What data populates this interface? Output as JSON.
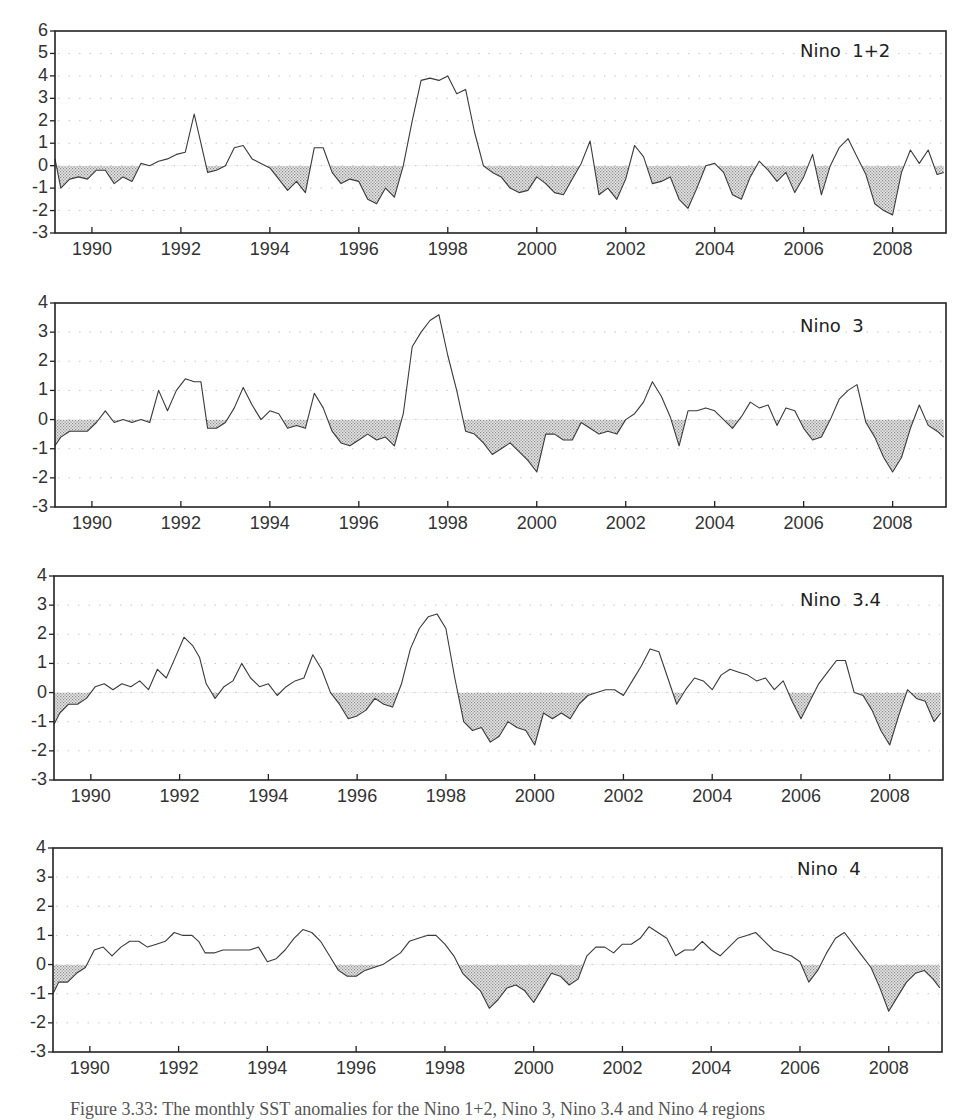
{
  "figure": {
    "caption": "Figure 3.33: The monthly SST anomalies for the Nino 1+2, Nino 3, Nino 3.4 and Nino 4 regions"
  },
  "chart_data": [
    {
      "type": "area",
      "title": "Nino  1+2",
      "xlabel": "",
      "ylabel": "",
      "xlim": [
        1989.17,
        2009.2
      ],
      "ylim": [
        -3,
        6
      ],
      "yticks": [
        6,
        5,
        4,
        3,
        2,
        1,
        0,
        -1,
        -2,
        -3
      ],
      "xticks": [
        1990,
        1992,
        1994,
        1996,
        1998,
        2000,
        2002,
        2004,
        2006,
        2008
      ],
      "grid": "dotted-horizontal",
      "negative_fill": "stippled-gray",
      "x": [
        1989.17,
        1989.3,
        1989.5,
        1989.7,
        1989.9,
        1990.1,
        1990.3,
        1990.5,
        1990.7,
        1990.9,
        1991.1,
        1991.3,
        1991.5,
        1991.7,
        1991.9,
        1992.1,
        1992.3,
        1992.45,
        1992.6,
        1992.8,
        1993.0,
        1993.2,
        1993.4,
        1993.6,
        1993.8,
        1994.0,
        1994.2,
        1994.4,
        1994.6,
        1994.8,
        1995.0,
        1995.2,
        1995.4,
        1995.6,
        1995.8,
        1996.0,
        1996.2,
        1996.4,
        1996.6,
        1996.8,
        1997.0,
        1997.2,
        1997.4,
        1997.6,
        1997.8,
        1998.0,
        1998.2,
        1998.4,
        1998.6,
        1998.8,
        1999.0,
        1999.2,
        1999.4,
        1999.6,
        1999.8,
        2000.0,
        2000.2,
        2000.4,
        2000.6,
        2000.8,
        2001.0,
        2001.2,
        2001.4,
        2001.6,
        2001.8,
        2002.0,
        2002.2,
        2002.4,
        2002.6,
        2002.8,
        2003.0,
        2003.2,
        2003.4,
        2003.6,
        2003.8,
        2004.0,
        2004.2,
        2004.4,
        2004.6,
        2004.8,
        2005.0,
        2005.2,
        2005.4,
        2005.6,
        2005.8,
        2006.0,
        2006.2,
        2006.4,
        2006.6,
        2006.8,
        2007.0,
        2007.2,
        2007.4,
        2007.6,
        2007.8,
        2008.0,
        2008.2,
        2008.4,
        2008.6,
        2008.8,
        2009.0,
        2009.15
      ],
      "values": [
        0.3,
        -1.0,
        -0.6,
        -0.5,
        -0.6,
        -0.2,
        -0.2,
        -0.8,
        -0.5,
        -0.7,
        0.1,
        0.0,
        0.2,
        0.3,
        0.5,
        0.6,
        2.3,
        1.0,
        -0.3,
        -0.2,
        0.0,
        0.8,
        0.9,
        0.3,
        0.1,
        -0.1,
        -0.6,
        -1.1,
        -0.7,
        -1.2,
        0.8,
        0.8,
        -0.3,
        -0.8,
        -0.6,
        -0.7,
        -1.5,
        -1.7,
        -1.0,
        -1.4,
        0.0,
        2.0,
        3.8,
        3.9,
        3.8,
        4.0,
        3.2,
        3.4,
        1.5,
        0.0,
        -0.3,
        -0.5,
        -1.0,
        -1.2,
        -1.1,
        -0.5,
        -0.8,
        -1.2,
        -1.3,
        -0.6,
        0.1,
        1.1,
        -1.3,
        -1.0,
        -1.5,
        -0.6,
        0.9,
        0.4,
        -0.8,
        -0.7,
        -0.5,
        -1.5,
        -1.9,
        -1.0,
        0.0,
        0.1,
        -0.3,
        -1.3,
        -1.5,
        -0.5,
        0.2,
        -0.2,
        -0.7,
        -0.3,
        -1.2,
        -0.5,
        0.5,
        -1.3,
        0.0,
        0.8,
        1.2,
        0.4,
        -0.4,
        -1.7,
        -2.0,
        -2.2,
        -0.3,
        0.7,
        0.1,
        0.7,
        -0.4,
        -0.3
      ]
    },
    {
      "type": "area",
      "title": "Nino  3",
      "xlabel": "",
      "ylabel": "",
      "xlim": [
        1989.17,
        2009.2
      ],
      "ylim": [
        -3,
        4
      ],
      "yticks": [
        4,
        3,
        2,
        1,
        0,
        -1,
        -2,
        -3
      ],
      "xticks": [
        1990,
        1992,
        1994,
        1996,
        1998,
        2000,
        2002,
        2004,
        2006,
        2008
      ],
      "grid": "dotted-horizontal",
      "negative_fill": "stippled-gray",
      "x": [
        1989.17,
        1989.3,
        1989.5,
        1989.7,
        1989.9,
        1990.1,
        1990.3,
        1990.5,
        1990.7,
        1990.9,
        1991.1,
        1991.3,
        1991.5,
        1991.7,
        1991.9,
        1992.1,
        1992.3,
        1992.45,
        1992.6,
        1992.8,
        1993.0,
        1993.2,
        1993.4,
        1993.6,
        1993.8,
        1994.0,
        1994.2,
        1994.4,
        1994.6,
        1994.8,
        1995.0,
        1995.2,
        1995.4,
        1995.6,
        1995.8,
        1996.0,
        1996.2,
        1996.4,
        1996.6,
        1996.8,
        1997.0,
        1997.2,
        1997.4,
        1997.6,
        1997.8,
        1998.0,
        1998.2,
        1998.4,
        1998.6,
        1998.8,
        1999.0,
        1999.2,
        1999.4,
        1999.6,
        1999.8,
        2000.0,
        2000.2,
        2000.4,
        2000.6,
        2000.8,
        2001.0,
        2001.2,
        2001.4,
        2001.6,
        2001.8,
        2002.0,
        2002.2,
        2002.4,
        2002.6,
        2002.8,
        2003.0,
        2003.2,
        2003.4,
        2003.6,
        2003.8,
        2004.0,
        2004.2,
        2004.4,
        2004.6,
        2004.8,
        2005.0,
        2005.2,
        2005.4,
        2005.6,
        2005.8,
        2006.0,
        2006.2,
        2006.4,
        2006.6,
        2006.8,
        2007.0,
        2007.2,
        2007.4,
        2007.6,
        2007.8,
        2008.0,
        2008.2,
        2008.4,
        2008.6,
        2008.8,
        2009.0,
        2009.15
      ],
      "values": [
        -0.9,
        -0.6,
        -0.4,
        -0.4,
        -0.4,
        -0.1,
        0.3,
        -0.1,
        0.0,
        -0.1,
        0.0,
        -0.1,
        1.0,
        0.3,
        1.0,
        1.4,
        1.3,
        1.3,
        -0.3,
        -0.3,
        -0.1,
        0.4,
        1.1,
        0.5,
        0.0,
        0.3,
        0.2,
        -0.3,
        -0.2,
        -0.3,
        0.9,
        0.4,
        -0.4,
        -0.8,
        -0.9,
        -0.7,
        -0.5,
        -0.7,
        -0.6,
        -0.9,
        0.2,
        2.5,
        3.0,
        3.4,
        3.6,
        2.2,
        1.0,
        -0.4,
        -0.5,
        -0.8,
        -1.2,
        -1.0,
        -0.8,
        -1.1,
        -1.4,
        -1.8,
        -0.5,
        -0.5,
        -0.7,
        -0.7,
        -0.1,
        -0.3,
        -0.5,
        -0.4,
        -0.5,
        0.0,
        0.2,
        0.6,
        1.3,
        0.8,
        0.1,
        -0.9,
        0.3,
        0.3,
        0.4,
        0.3,
        0.0,
        -0.3,
        0.1,
        0.6,
        0.4,
        0.5,
        -0.2,
        0.4,
        0.3,
        -0.3,
        -0.7,
        -0.6,
        0.0,
        0.7,
        1.0,
        1.2,
        -0.1,
        -0.6,
        -1.3,
        -1.8,
        -1.3,
        -0.3,
        0.5,
        -0.2,
        -0.4,
        -0.6
      ]
    },
    {
      "type": "area",
      "title": "Nino  3.4",
      "xlabel": "",
      "ylabel": "",
      "xlim": [
        1989.17,
        2009.2
      ],
      "ylim": [
        -3,
        4
      ],
      "yticks": [
        4,
        3,
        2,
        1,
        0,
        -1,
        -2,
        -3
      ],
      "xticks": [
        1990,
        1992,
        1994,
        1996,
        1998,
        2000,
        2002,
        2004,
        2006,
        2008
      ],
      "grid": "dotted-horizontal",
      "negative_fill": "stippled-gray",
      "x": [
        1989.17,
        1989.3,
        1989.5,
        1989.7,
        1989.9,
        1990.1,
        1990.3,
        1990.5,
        1990.7,
        1990.9,
        1991.1,
        1991.3,
        1991.5,
        1991.7,
        1991.9,
        1992.1,
        1992.3,
        1992.45,
        1992.6,
        1992.8,
        1993.0,
        1993.2,
        1993.4,
        1993.6,
        1993.8,
        1994.0,
        1994.2,
        1994.4,
        1994.6,
        1994.8,
        1995.0,
        1995.2,
        1995.4,
        1995.6,
        1995.8,
        1996.0,
        1996.2,
        1996.4,
        1996.6,
        1996.8,
        1997.0,
        1997.2,
        1997.4,
        1997.6,
        1997.8,
        1998.0,
        1998.2,
        1998.4,
        1998.6,
        1998.8,
        1999.0,
        1999.2,
        1999.4,
        1999.6,
        1999.8,
        2000.0,
        2000.2,
        2000.4,
        2000.6,
        2000.8,
        2001.0,
        2001.2,
        2001.4,
        2001.6,
        2001.8,
        2002.0,
        2002.2,
        2002.4,
        2002.6,
        2002.8,
        2003.0,
        2003.2,
        2003.4,
        2003.6,
        2003.8,
        2004.0,
        2004.2,
        2004.4,
        2004.6,
        2004.8,
        2005.0,
        2005.2,
        2005.4,
        2005.6,
        2005.8,
        2006.0,
        2006.2,
        2006.4,
        2006.6,
        2006.8,
        2007.0,
        2007.2,
        2007.4,
        2007.6,
        2007.8,
        2008.0,
        2008.2,
        2008.4,
        2008.6,
        2008.8,
        2009.0,
        2009.15
      ],
      "values": [
        -1.1,
        -0.7,
        -0.4,
        -0.4,
        -0.2,
        0.2,
        0.3,
        0.1,
        0.3,
        0.2,
        0.4,
        0.1,
        0.8,
        0.5,
        1.2,
        1.9,
        1.6,
        1.2,
        0.3,
        -0.2,
        0.2,
        0.4,
        1.0,
        0.5,
        0.2,
        0.3,
        -0.1,
        0.2,
        0.4,
        0.5,
        1.3,
        0.8,
        0.0,
        -0.4,
        -0.9,
        -0.8,
        -0.6,
        -0.2,
        -0.4,
        -0.5,
        0.3,
        1.5,
        2.2,
        2.6,
        2.7,
        2.2,
        0.5,
        -1.0,
        -1.3,
        -1.2,
        -1.7,
        -1.5,
        -1.0,
        -1.2,
        -1.3,
        -1.8,
        -0.7,
        -0.9,
        -0.7,
        -0.9,
        -0.4,
        -0.1,
        0.0,
        0.1,
        0.1,
        -0.1,
        0.4,
        0.9,
        1.5,
        1.4,
        0.5,
        -0.4,
        0.1,
        0.5,
        0.4,
        0.1,
        0.6,
        0.8,
        0.7,
        0.6,
        0.4,
        0.5,
        0.1,
        0.4,
        -0.3,
        -0.9,
        -0.3,
        0.3,
        0.7,
        1.1,
        1.1,
        0.0,
        -0.1,
        -0.6,
        -1.3,
        -1.8,
        -0.8,
        0.1,
        -0.2,
        -0.3,
        -1.0,
        -0.7
      ]
    },
    {
      "type": "area",
      "title": "Nino  4",
      "xlabel": "",
      "ylabel": "",
      "xlim": [
        1989.17,
        2009.2
      ],
      "ylim": [
        -3,
        4
      ],
      "yticks": [
        4,
        3,
        2,
        1,
        0,
        -1,
        -2,
        -3
      ],
      "xticks": [
        1990,
        1992,
        1994,
        1996,
        1998,
        2000,
        2002,
        2004,
        2006,
        2008
      ],
      "grid": "dotted-horizontal",
      "negative_fill": "stippled-gray",
      "x": [
        1989.17,
        1989.3,
        1989.5,
        1989.7,
        1989.9,
        1990.1,
        1990.3,
        1990.5,
        1990.7,
        1990.9,
        1991.1,
        1991.3,
        1991.5,
        1991.7,
        1991.9,
        1992.1,
        1992.3,
        1992.45,
        1992.6,
        1992.8,
        1993.0,
        1993.2,
        1993.4,
        1993.6,
        1993.8,
        1994.0,
        1994.2,
        1994.4,
        1994.6,
        1994.8,
        1995.0,
        1995.2,
        1995.4,
        1995.6,
        1995.8,
        1996.0,
        1996.2,
        1996.4,
        1996.6,
        1996.8,
        1997.0,
        1997.2,
        1997.4,
        1997.6,
        1997.8,
        1998.0,
        1998.2,
        1998.4,
        1998.6,
        1998.8,
        1999.0,
        1999.2,
        1999.4,
        1999.6,
        1999.8,
        2000.0,
        2000.2,
        2000.4,
        2000.6,
        2000.8,
        2001.0,
        2001.2,
        2001.4,
        2001.6,
        2001.8,
        2002.0,
        2002.2,
        2002.4,
        2002.6,
        2002.8,
        2003.0,
        2003.2,
        2003.4,
        2003.6,
        2003.8,
        2004.0,
        2004.2,
        2004.4,
        2004.6,
        2004.8,
        2005.0,
        2005.2,
        2005.4,
        2005.6,
        2005.8,
        2006.0,
        2006.2,
        2006.4,
        2006.6,
        2006.8,
        2007.0,
        2007.2,
        2007.4,
        2007.6,
        2007.8,
        2008.0,
        2008.2,
        2008.4,
        2008.6,
        2008.8,
        2009.0,
        2009.15
      ],
      "values": [
        -1.0,
        -0.6,
        -0.6,
        -0.3,
        -0.1,
        0.5,
        0.6,
        0.3,
        0.6,
        0.8,
        0.8,
        0.6,
        0.7,
        0.8,
        1.1,
        1.0,
        1.0,
        0.8,
        0.4,
        0.4,
        0.5,
        0.5,
        0.5,
        0.5,
        0.6,
        0.1,
        0.2,
        0.5,
        0.9,
        1.2,
        1.1,
        0.8,
        0.3,
        -0.2,
        -0.4,
        -0.4,
        -0.2,
        -0.1,
        0.0,
        0.2,
        0.4,
        0.8,
        0.9,
        1.0,
        1.0,
        0.7,
        0.3,
        -0.3,
        -0.6,
        -0.9,
        -1.5,
        -1.2,
        -0.8,
        -0.7,
        -0.9,
        -1.3,
        -0.8,
        -0.3,
        -0.4,
        -0.7,
        -0.5,
        0.3,
        0.6,
        0.6,
        0.4,
        0.7,
        0.7,
        0.9,
        1.3,
        1.1,
        0.9,
        0.3,
        0.5,
        0.5,
        0.8,
        0.5,
        0.3,
        0.6,
        0.9,
        1.0,
        1.1,
        0.8,
        0.5,
        0.4,
        0.3,
        0.1,
        -0.6,
        -0.2,
        0.4,
        0.9,
        1.1,
        0.7,
        0.3,
        -0.1,
        -0.8,
        -1.6,
        -1.1,
        -0.6,
        -0.3,
        -0.2,
        -0.5,
        -0.8
      ]
    }
  ]
}
